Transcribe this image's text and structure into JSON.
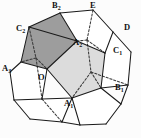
{
  "figure": {
    "kind": "regular-dodecahedron-net-projection",
    "caption": "",
    "colors": {
      "background": "#fcfcfc",
      "stroke": "#1a1a1a",
      "dashed_stroke": "#3a3a3a",
      "dark_face_fill": "#9d9d9d",
      "light_face_fill": "#dcdcdc",
      "white_face_fill": "#ffffff",
      "label_color": "#111111"
    },
    "stroke_width": 1.05,
    "dash_pattern": "2.2,1.8"
  },
  "labels": [
    {
      "id": "B2",
      "letter": "B",
      "sub": "2",
      "x": 52,
      "y": 1,
      "anchor": "start"
    },
    {
      "id": "E",
      "letter": "E",
      "sub": "",
      "x": 90,
      "y": 1,
      "anchor": "start"
    },
    {
      "id": "C2",
      "letter": "C",
      "sub": "2",
      "x": 16,
      "y": 24,
      "anchor": "start"
    },
    {
      "id": "D",
      "letter": "D",
      "sub": "",
      "x": 124,
      "y": 23,
      "anchor": "start"
    },
    {
      "id": "A2",
      "letter": "A",
      "sub": "2",
      "x": 73,
      "y": 38,
      "anchor": "start"
    },
    {
      "id": "C1",
      "letter": "C",
      "sub": "1",
      "x": 113,
      "y": 46,
      "anchor": "start"
    },
    {
      "id": "A3",
      "letter": "A",
      "sub": "3",
      "x": 2,
      "y": 64,
      "anchor": "start"
    },
    {
      "id": "O",
      "letter": "O",
      "sub": "",
      "x": 38,
      "y": 73,
      "anchor": "start"
    },
    {
      "id": "B1",
      "letter": "B",
      "sub": "1",
      "x": 115,
      "y": 83,
      "anchor": "start"
    },
    {
      "id": "A1",
      "letter": "A",
      "sub": "1",
      "x": 64,
      "y": 99,
      "anchor": "start"
    }
  ],
  "faces": [
    {
      "name": "dark-pentagon-upper-left",
      "fill": "#9d9d9d",
      "points": "29,27 60,13 77,41 47,69 21,62"
    },
    {
      "name": "light-pentagon-center",
      "fill": "#dcdcdc",
      "points": "47,69 77,41 105,53 101,88 72,98"
    },
    {
      "name": "white-face-top-right",
      "fill": "#ffffff",
      "points": "60,13 93,10 113,32 105,53 77,41"
    },
    {
      "name": "white-face-right",
      "fill": "#ffffff",
      "points": "113,32 131,52 128,85 101,88 105,53"
    },
    {
      "name": "white-face-left",
      "fill": "#ffffff",
      "points": "21,62 47,69 42,99 14,100 10,72"
    },
    {
      "name": "white-face-bottom-left",
      "fill": "#ffffff",
      "points": "14,100 42,99 72,98 62,122 30,119"
    },
    {
      "name": "white-face-bottom-right",
      "fill": "#ffffff",
      "points": "72,98 101,88 121,104 106,124 80,125"
    }
  ],
  "solid_edges": [
    "60,13 93,10",
    "93,10 113,32",
    "113,32 131,52",
    "131,52 128,85",
    "128,85 121,104",
    "121,104 106,124",
    "106,124 80,125",
    "80,125 62,122",
    "62,122 30,119",
    "30,119 14,100",
    "14,100 10,72",
    "10,72 21,62",
    "21,62 29,27",
    "29,27 60,13",
    "60,13 77,41",
    "77,41 29,27",
    "77,41 105,53",
    "105,53 113,32",
    "105,53 101,88",
    "101,88 128,85",
    "101,88 121,104",
    "21,62 47,69",
    "47,69 77,41",
    "47,69 42,99",
    "42,99 14,100",
    "47,69 72,98",
    "72,98 101,88",
    "72,98 62,122",
    "72,98 80,125",
    "42,99 72,98"
  ],
  "dashed_edges": [
    "93,10 87,40",
    "87,40 105,53",
    "87,40 77,41",
    "29,27 36,58",
    "36,58 21,62",
    "36,58 47,69",
    "36,58 42,99",
    "87,40 91,72",
    "91,72 101,88",
    "91,72 72,98",
    "91,72 128,85",
    "42,99 62,122"
  ]
}
